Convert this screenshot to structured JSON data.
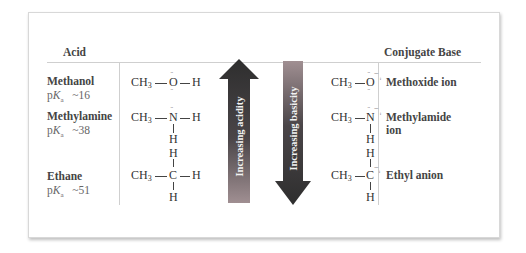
{
  "headers": {
    "acid": "Acid",
    "conjugate_base": "Conjugate Base"
  },
  "rows": [
    {
      "name": "Methanol",
      "pka_prefix": "p",
      "pka_K": "K",
      "pka_sub": "a",
      "pka_value": "~16",
      "acid_formula": {
        "ch3": "CH",
        "sub": "3",
        "center": "O",
        "right": "H"
      },
      "base_formula": {
        "ch3": "CH",
        "sub": "3",
        "center": "O"
      },
      "base_name": "Methoxide ion"
    },
    {
      "name": "Methylamine",
      "pka_prefix": "p",
      "pka_K": "K",
      "pka_sub": "a",
      "pka_value": "~38",
      "acid_formula": {
        "ch3": "CH",
        "sub": "3",
        "center": "N",
        "right": "H",
        "below": "H"
      },
      "base_formula": {
        "ch3": "CH",
        "sub": "3",
        "center": "N",
        "below": "H"
      },
      "base_name_line1": "Methylamide",
      "base_name_line2": "ion"
    },
    {
      "name": "Ethane",
      "pka_prefix": "p",
      "pka_K": "K",
      "pka_sub": "a",
      "pka_value": "~51",
      "acid_formula": {
        "ch3": "CH",
        "sub": "3",
        "center": "C",
        "right": "H",
        "above": "H",
        "below": "H"
      },
      "base_formula": {
        "ch3": "CH",
        "sub": "3",
        "center": "C",
        "above": "H",
        "below": "H"
      },
      "base_name": "Ethyl anion"
    }
  ],
  "arrows": {
    "acidity": {
      "label": "Increasing acidity",
      "direction": "up"
    },
    "basicity": {
      "label": "Increasing basicity",
      "direction": "down"
    }
  },
  "symbols": {
    "lone_pair": "··",
    "negative": "−"
  },
  "colors": {
    "arrow_dark": "#2e2e2e",
    "arrow_light": "#a08f92",
    "rule": "#cfcfcf",
    "text": "#444444"
  }
}
